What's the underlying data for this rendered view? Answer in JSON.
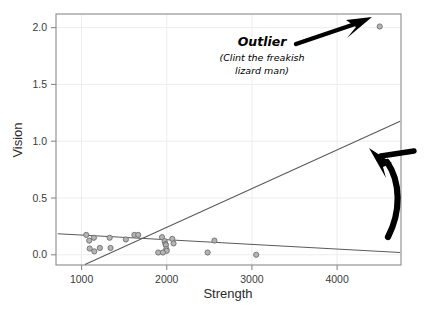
{
  "chart_data": {
    "type": "scatter",
    "title": "",
    "xlabel": "Strength",
    "ylabel": "Vision",
    "xlim": [
      700,
      4750
    ],
    "ylim": [
      -0.09,
      2.12
    ],
    "xticks": [
      1000,
      2000,
      3000,
      4000
    ],
    "xticklabels": [
      "1000",
      "2000",
      "3000",
      "4000"
    ],
    "yticks": [
      0.0,
      0.5,
      1.0,
      1.5,
      2.0
    ],
    "yticklabels": [
      "0.0",
      "0.5",
      "1.0",
      "1.5",
      "2.0"
    ],
    "grid": true,
    "legend": "none",
    "marker": {
      "shape": "circle",
      "fill": "#b4b4b4",
      "stroke": "#6e6e6e",
      "radius": 2.6
    },
    "points": [
      {
        "x": 1055,
        "y": 0.175
      },
      {
        "x": 1090,
        "y": 0.125
      },
      {
        "x": 1095,
        "y": 0.055
      },
      {
        "x": 1145,
        "y": 0.15
      },
      {
        "x": 1150,
        "y": 0.03
      },
      {
        "x": 1215,
        "y": 0.06
      },
      {
        "x": 1330,
        "y": 0.15
      },
      {
        "x": 1340,
        "y": 0.06
      },
      {
        "x": 1520,
        "y": 0.135
      },
      {
        "x": 1620,
        "y": 0.175
      },
      {
        "x": 1665,
        "y": 0.175
      },
      {
        "x": 1945,
        "y": 0.155
      },
      {
        "x": 1975,
        "y": 0.12
      },
      {
        "x": 1985,
        "y": 0.095
      },
      {
        "x": 1990,
        "y": 0.085
      },
      {
        "x": 1995,
        "y": 0.05
      },
      {
        "x": 2000,
        "y": 0.035
      },
      {
        "x": 2065,
        "y": 0.14
      },
      {
        "x": 2080,
        "y": 0.1
      },
      {
        "x": 1900,
        "y": 0.02
      },
      {
        "x": 1955,
        "y": 0.02
      },
      {
        "x": 2560,
        "y": 0.125
      },
      {
        "x": 2480,
        "y": 0.02
      },
      {
        "x": 3050,
        "y": 0.0
      },
      {
        "x": 4500,
        "y": 2.01
      }
    ],
    "lines": [
      {
        "name": "regression-with-outlier",
        "color": "#5a5a5a",
        "x1": 1040,
        "y1": -0.085,
        "x2": 4740,
        "y2": 1.175
      },
      {
        "name": "regression-without-outlier",
        "color": "#5a5a5a",
        "x1": 720,
        "y1": 0.185,
        "x2": 4740,
        "y2": 0.02
      }
    ],
    "annotations": [
      {
        "name": "outlier-label",
        "line1": "Outlier",
        "line2": "(Clint the freakish",
        "line3": "lizard man)",
        "points_to": {
          "x": 4500,
          "y": 2.01
        }
      },
      {
        "name": "trend-line-arrow",
        "text": "",
        "points_to": {
          "x": 4050,
          "y": 0.98
        }
      }
    ],
    "colors": {
      "frame": "#8a8a8a",
      "grid": "#ededed",
      "marker_fill": "#b4b4b4",
      "marker_stroke": "#6e6e6e",
      "line": "#5a5a5a",
      "annotation": "#000000",
      "text": "#2b2b2b"
    }
  }
}
